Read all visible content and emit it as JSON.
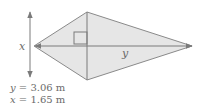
{
  "diagram": {
    "type": "kite",
    "colors": {
      "fill": "#e6e6e6",
      "stroke": "#7a7a7a",
      "text": "#6b6b6b"
    },
    "labels": {
      "vertical_diagonal": "x",
      "horizontal_diagonal": "y"
    },
    "right_angle_marker": true
  },
  "given": [
    {
      "var": "y",
      "eq": " = 3.06 m"
    },
    {
      "var": "x",
      "eq": " = 1.65 m"
    }
  ]
}
